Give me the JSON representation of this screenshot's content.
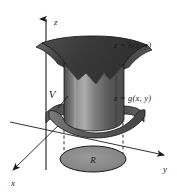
{
  "figure": {
    "type": "3d-solid-region-diagram",
    "background_color": "#ffffff",
    "ink_color": "#1a1a1a"
  },
  "axes": {
    "z_label": "z",
    "y_label": "y",
    "x_label": "x"
  },
  "labels": {
    "upper_surface": "z = h(x, y)",
    "lower_surface": "z = g(x, y)",
    "solid_region": "V",
    "base_region": "R"
  },
  "colors": {
    "upper_surface_fill": "#3a3a3a",
    "upper_surface_fill_light": "#575757",
    "solid_body_fill": "#6a6a6a",
    "solid_body_fill_dark": "#4a4a4a",
    "solid_body_fill_light": "#9a9a9a",
    "lower_surface_fill": "#5e5e5e",
    "lower_surface_fill_light": "#7d7d7d",
    "base_region_fill": "#848484",
    "outline": "#1a1a1a"
  }
}
